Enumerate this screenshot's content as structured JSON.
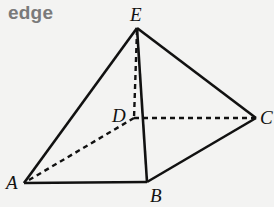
{
  "title": "edge",
  "diagram": {
    "type": "square-pyramid",
    "vertices": {
      "E": {
        "label": "E",
        "x": 137,
        "y": 28
      },
      "D": {
        "label": "D",
        "x": 134,
        "y": 118
      },
      "C": {
        "label": "C",
        "x": 256,
        "y": 118
      },
      "A": {
        "label": "A",
        "x": 24,
        "y": 183
      },
      "B": {
        "label": "B",
        "x": 147,
        "y": 182
      }
    },
    "solid_edges": [
      [
        "E",
        "A"
      ],
      [
        "E",
        "B"
      ],
      [
        "E",
        "C"
      ],
      [
        "A",
        "B"
      ],
      [
        "B",
        "C"
      ]
    ],
    "dashed_edges": [
      [
        "E",
        "D"
      ],
      [
        "D",
        "A"
      ],
      [
        "D",
        "C"
      ]
    ],
    "colors": {
      "edge": "#111111",
      "title": "#7a7a7a",
      "background": "#f3f3f2"
    }
  }
}
